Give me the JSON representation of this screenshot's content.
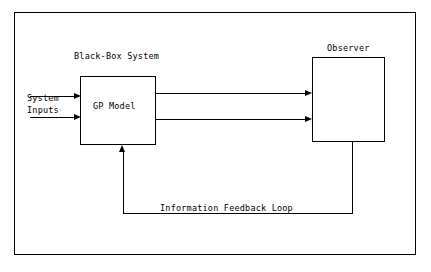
{
  "diagram": {
    "title_blackbox": "Black-Box System",
    "title_observer": "Observer",
    "gp_model_label": "GP Model",
    "system_inputs_label": "System\nInputs",
    "feedback_label": "Information Feedback Loop",
    "colors": {
      "stroke": "#000000",
      "background": "#ffffff"
    },
    "nodes": [
      {
        "id": "black-box-system",
        "label": "Black-Box System"
      },
      {
        "id": "gp-model",
        "label": "GP Model"
      },
      {
        "id": "observer",
        "label": "Observer"
      }
    ],
    "edges": [
      {
        "id": "system-inputs-1",
        "label": "System Inputs",
        "from": "external",
        "to": "gp-model"
      },
      {
        "id": "system-inputs-2",
        "label": "System Inputs",
        "from": "external",
        "to": "gp-model"
      },
      {
        "id": "output-1",
        "label": "",
        "from": "gp-model",
        "to": "observer"
      },
      {
        "id": "output-2",
        "label": "",
        "from": "gp-model",
        "to": "observer"
      },
      {
        "id": "feedback",
        "label": "Information Feedback Loop",
        "from": "observer",
        "to": "gp-model"
      }
    ]
  }
}
